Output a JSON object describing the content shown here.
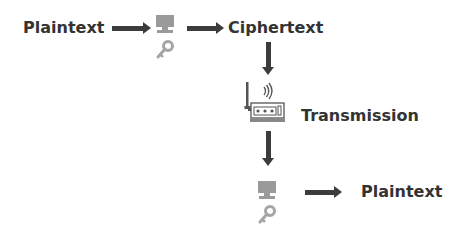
{
  "diagram": {
    "nodes": {
      "plaintext_in": "Plaintext",
      "ciphertext": "Ciphertext",
      "transmission": "Transmission",
      "plaintext_out": "Plaintext"
    },
    "icons": {
      "encrypt_computer": "computer-icon",
      "encrypt_key": "key-icon",
      "router": "wireless-router-icon",
      "decrypt_computer": "computer-icon",
      "decrypt_key": "key-icon"
    },
    "colors": {
      "text": "#333333",
      "arrow": "#3c3c3c",
      "icon": "#9a9a9a"
    }
  }
}
